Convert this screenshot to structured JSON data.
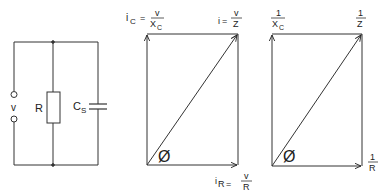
{
  "circuit": {
    "source_label": "v",
    "resistor_label": "R",
    "capacitor_label": "C",
    "capacitor_subscript": "S"
  },
  "current_diagram": {
    "ic_prefix": "i",
    "ic_sub": "C",
    "ic_eq": "=",
    "ic_num": "v",
    "ic_den": "X",
    "ic_den_sub": "C",
    "i_prefix": "i",
    "i_eq": "=",
    "i_num": "v",
    "i_den": "Z",
    "ir_prefix": "i",
    "ir_sub": "R",
    "ir_eq": "=",
    "ir_num": "v",
    "ir_den": "R",
    "angle_label": "Ø"
  },
  "admittance_diagram": {
    "bc_num": "1",
    "bc_den": "X",
    "bc_den_sub": "C",
    "y_num": "1",
    "y_den": "Z",
    "g_num": "1",
    "g_den": "R",
    "angle_label": "Ø"
  }
}
